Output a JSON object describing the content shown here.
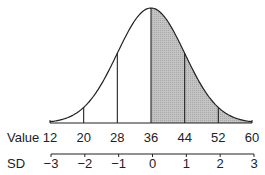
{
  "chart_data": {
    "type": "area",
    "title": "",
    "mean": 36,
    "sd": 8,
    "shaded_region": {
      "from": 36,
      "to": 60
    },
    "x_axis_label": "Value",
    "x_ticks": [
      12,
      20,
      28,
      36,
      44,
      52,
      60
    ],
    "sd_axis_label": "SD",
    "sd_ticks": [
      "−3",
      "−2",
      "−1",
      "0",
      "1",
      "2",
      "3"
    ],
    "vertical_lines_at": [
      20,
      28,
      36,
      44,
      52
    ],
    "xlim": [
      12,
      60
    ],
    "grid": false,
    "colors": {
      "shade": "#b8b8b8",
      "line": "#222222"
    }
  },
  "labels": {
    "value_axis": "Value",
    "sd_axis": "SD",
    "value_ticks": [
      "12",
      "20",
      "28",
      "36",
      "44",
      "52",
      "60"
    ],
    "sd_ticks": [
      "−3",
      "−2",
      "−1",
      "0",
      "1",
      "2",
      "3"
    ]
  }
}
